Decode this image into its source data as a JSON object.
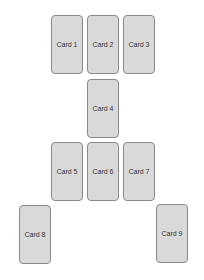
{
  "cards": [
    {
      "label": "Card 1",
      "x": 51,
      "y": 15
    },
    {
      "label": "Card 2",
      "x": 87,
      "y": 15
    },
    {
      "label": "Card 3",
      "x": 123,
      "y": 15
    },
    {
      "label": "Card 4",
      "x": 87,
      "y": 79
    },
    {
      "label": "Card 5",
      "x": 51,
      "y": 142
    },
    {
      "label": "Card 6",
      "x": 87,
      "y": 142
    },
    {
      "label": "Card 7",
      "x": 123,
      "y": 142
    },
    {
      "label": "Card 8",
      "x": 19,
      "y": 205
    },
    {
      "label": "Card 9",
      "x": 156,
      "y": 204
    }
  ]
}
